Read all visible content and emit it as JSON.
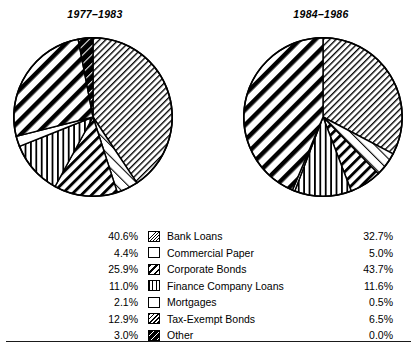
{
  "chart_data": [
    {
      "type": "pie",
      "title": "1977–1983",
      "categories": [
        "Bank Loans",
        "Commercial Paper",
        "Corporate Bonds",
        "Finance Company Loans",
        "Mortgages",
        "Tax-Exempt Bonds",
        "Other"
      ],
      "values": [
        40.6,
        4.4,
        25.9,
        11.0,
        2.1,
        12.9,
        3.0
      ],
      "value_labels": [
        "40.6%",
        "4.4%",
        "25.9%",
        "11.0%",
        "2.1%",
        "12.9%",
        "3.0%"
      ],
      "units": "percent",
      "legend_position": "bottom-center",
      "start_angle": 0,
      "direction": "clockwise",
      "slice_order_clockwise_from_top": [
        "Bank Loans",
        "Commercial Paper",
        "Tax-Exempt Bonds",
        "Finance Company Loans",
        "Mortgages",
        "Corporate Bonds",
        "Other"
      ]
    },
    {
      "type": "pie",
      "title": "1984–1986",
      "categories": [
        "Bank Loans",
        "Commercial Paper",
        "Corporate Bonds",
        "Finance Company Loans",
        "Mortgages",
        "Tax-Exempt Bonds",
        "Other"
      ],
      "values": [
        32.7,
        5.0,
        43.7,
        11.6,
        0.5,
        6.5,
        0.0
      ],
      "value_labels": [
        "32.7%",
        "5.0%",
        "43.7%",
        "11.6%",
        "0.5%",
        "6.5%",
        "0.0%"
      ],
      "units": "percent",
      "legend_position": "bottom-center",
      "start_angle": 0,
      "direction": "clockwise",
      "slice_order_clockwise_from_top": [
        "Bank Loans",
        "Commercial Paper",
        "Tax-Exempt Bonds",
        "Finance Company Loans",
        "Mortgages",
        "Corporate Bonds"
      ]
    }
  ],
  "titles": {
    "left": "1977–1983",
    "right": "1984–1986"
  },
  "legend": {
    "rows": [
      {
        "pct_left": "40.6%",
        "label": "Bank Loans",
        "pct_right": "32.7%",
        "pattern": "fine-diagonal-hatch"
      },
      {
        "pct_left": "4.4%",
        "label": "Commercial Paper",
        "pct_right": "5.0%",
        "pattern": "sparse-dotted"
      },
      {
        "pct_left": "25.9%",
        "label": "Corporate Bonds",
        "pct_right": "43.7%",
        "pattern": "bold-diagonal-stripe"
      },
      {
        "pct_left": "11.0%",
        "label": "Finance Company Loans",
        "pct_right": "11.6%",
        "pattern": "vertical-lines"
      },
      {
        "pct_left": "2.1%",
        "label": "Mortgages",
        "pct_right": "0.5%",
        "pattern": "solid-white"
      },
      {
        "pct_left": "12.9%",
        "label": "Tax-Exempt Bonds",
        "pct_right": "6.5%",
        "pattern": "medium-diagonal-hatch"
      },
      {
        "pct_left": "3.0%",
        "label": "Other",
        "pct_right": "0.0%",
        "pattern": "dark-diagonal-solid"
      }
    ]
  },
  "colors": {
    "ink": "#000000",
    "paper": "#ffffff",
    "rule": "#1a1a1a"
  }
}
